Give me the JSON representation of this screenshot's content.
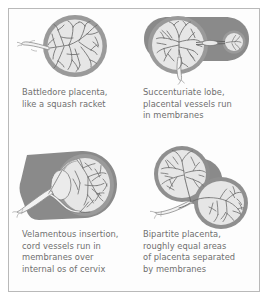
{
  "figure": {
    "border_color": "#b9b9b9",
    "background": "#fdfdfd",
    "text_color": "#6f6f6f"
  },
  "palette": {
    "membrane_gray": "#8a8a8a",
    "rim_gray": "#9a9a9a",
    "disc_fill": "#e4e4e4",
    "vessel_stroke": "#6a6a6a",
    "cord_fill": "#f0f0f0"
  },
  "panels": [
    {
      "id": "battledore",
      "name": "battledore-placenta",
      "caption": "Battledore placenta,\nlike a squash racket"
    },
    {
      "id": "succenturiate",
      "name": "succenturiate-lobe",
      "caption": "Succenturiate lobe,\nplacental vessels run\nin membranes"
    },
    {
      "id": "velamentous",
      "name": "velamentous-insertion",
      "caption": "Velamentous insertion,\ncord vessels run in\nmembranes over\ninternal os of cervix"
    },
    {
      "id": "bipartite",
      "name": "bipartite-placenta",
      "caption": "Bipartite placenta,\nroughly equal areas\nof placenta separated\nby membranes"
    }
  ]
}
